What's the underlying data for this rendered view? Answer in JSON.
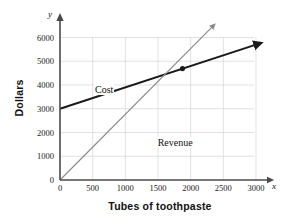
{
  "chart_data": {
    "type": "line",
    "title": "",
    "xlabel": "Tubes of toothpaste",
    "ylabel": "Dollars",
    "x_axis_name": "x",
    "y_axis_name": "y",
    "xlim": [
      0,
      3000
    ],
    "ylim": [
      0,
      6000
    ],
    "xticks": [
      0,
      500,
      1000,
      1500,
      2000,
      2500,
      3000
    ],
    "yticks": [
      0,
      1000,
      2000,
      3000,
      4000,
      5000,
      6000
    ],
    "xtick_labels": [
      "0",
      "500",
      "1000",
      "1500",
      "2000",
      "2500",
      "3000"
    ],
    "ytick_labels": [
      "0",
      "1000",
      "2000",
      "3000",
      "4000",
      "5000",
      "6000"
    ],
    "grid": true,
    "legend": "inline-labels",
    "series": [
      {
        "name": "Cost",
        "color": "#1a1a1a",
        "width": 2.1,
        "arrow": true,
        "points": [
          [
            0,
            3000
          ],
          [
            3000,
            5700
          ]
        ],
        "label_x": 520,
        "label_y": 3800
      },
      {
        "name": "Revenue",
        "color": "#8c8c8c",
        "width": 1.2,
        "arrow": true,
        "points": [
          [
            0,
            0
          ],
          [
            2330,
            6450
          ]
        ],
        "label_x": 1480,
        "label_y": 1550
      }
    ],
    "annotations": [
      {
        "name": "break-even-point",
        "type": "point",
        "x": 1875,
        "y": 4690,
        "color": "#1a1a1a",
        "radius": 2.6
      }
    ]
  }
}
